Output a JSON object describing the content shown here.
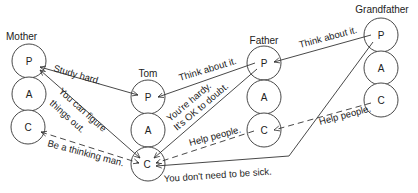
{
  "persons": [
    {
      "name": "Mother",
      "states": [
        "P",
        "A",
        "C"
      ]
    },
    {
      "name": "Tom",
      "states": [
        "P",
        "A",
        "C"
      ]
    },
    {
      "name": "Father",
      "states": [
        "P",
        "A",
        "C"
      ]
    },
    {
      "name": "Grandfather",
      "states": [
        "P",
        "A",
        "C"
      ]
    }
  ],
  "messages": [
    {
      "text": "Study hard.",
      "from": "Mother.P",
      "to": "Tom.P",
      "style": "solid"
    },
    {
      "text": "You can figure",
      "text2": "things out.",
      "from": "Mother.P",
      "to": "Tom.C",
      "style": "solid"
    },
    {
      "text": "Be a thinking man.",
      "from": "Mother.C",
      "to": "Tom.C",
      "style": "dashed"
    },
    {
      "text": "Think about it.",
      "from": "Father.P",
      "to": "Tom.P",
      "style": "solid"
    },
    {
      "text": "You're hardy.",
      "text2": "It's OK to doubt.",
      "from": "Father.P",
      "to": "Tom.C",
      "style": "solid"
    },
    {
      "text": "Help people.",
      "from": "Father.C",
      "to": "Tom.C",
      "style": "dashed"
    },
    {
      "text": "Think about it.",
      "from": "Grandfather.P",
      "to": "Father.P",
      "style": "solid"
    },
    {
      "text": "Help people.",
      "from": "Grandfather.C",
      "to": "Father.C",
      "style": "dashed"
    },
    {
      "text": "You don't need to be sick.",
      "from": "Grandfather.P",
      "to": "Tom.C",
      "style": "solid"
    }
  ]
}
